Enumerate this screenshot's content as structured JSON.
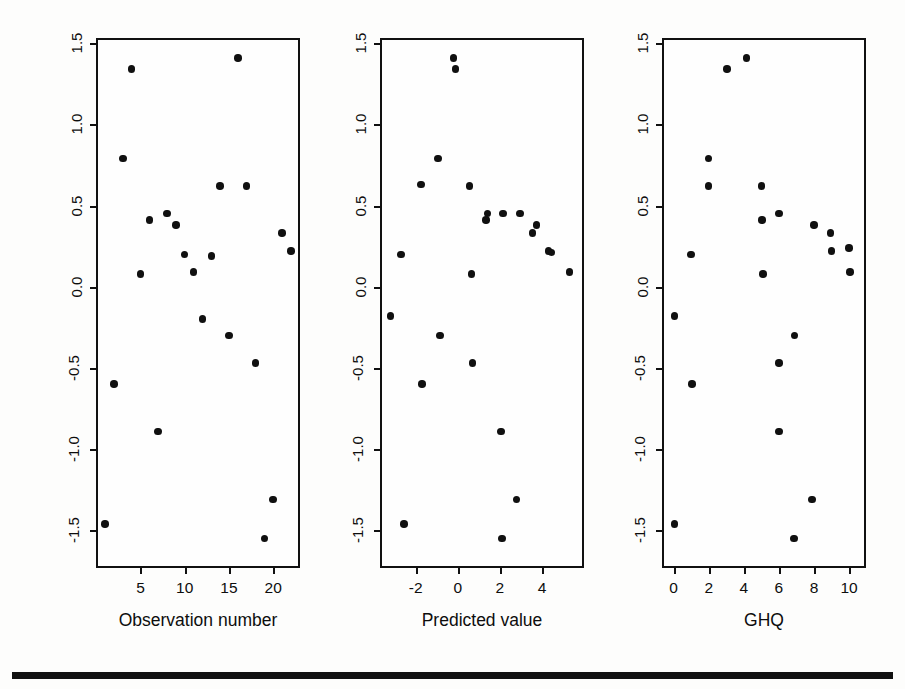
{
  "figure": {
    "shared_ylabel": "Standardized deviance residual",
    "ytick_labels": [
      "1.5",
      "1.0",
      "0.5",
      "0.0",
      "-0.5",
      "-1.0",
      "-1.5"
    ],
    "ytick_values": [
      1.5,
      1.0,
      0.5,
      0.0,
      -0.5,
      -1.0,
      -1.5
    ],
    "marker_color": "#101010",
    "frame_color": "#111111",
    "background_color": "#fdfdfc"
  },
  "chart_data": [
    {
      "type": "scatter",
      "title": "",
      "xlabel": "Observation number",
      "ylabel": "Standardized deviance residual",
      "xlim": [
        0.2,
        22.8
      ],
      "ylim": [
        -1.72,
        1.52
      ],
      "xticks": [
        5,
        10,
        15,
        20
      ],
      "xtick_labels": [
        "5",
        "10",
        "15",
        "20"
      ],
      "yticks": [
        1.5,
        1.0,
        0.5,
        0.0,
        -0.5,
        -1.0,
        -1.5
      ],
      "ytick_labels": [
        "1.5",
        "1.0",
        "0.5",
        "0.0",
        "-0.5",
        "-1.0",
        "-1.5"
      ],
      "grid": false,
      "legend": "none",
      "x": [
        1,
        2,
        3,
        4,
        5,
        6,
        7,
        8,
        9,
        10,
        11,
        12,
        13,
        14,
        15,
        16,
        17,
        18,
        19,
        20,
        21,
        22
      ],
      "y": [
        -1.46,
        -0.6,
        0.79,
        1.34,
        0.08,
        0.41,
        -0.89,
        0.45,
        0.38,
        0.2,
        0.09,
        -0.2,
        0.19,
        0.62,
        -0.3,
        1.41,
        0.62,
        -0.47,
        -1.55,
        -1.31,
        0.33,
        0.22
      ]
    },
    {
      "type": "scatter",
      "title": "",
      "xlabel": "Predicted value",
      "ylabel": "Standardized deviance residual",
      "xlim": [
        -3.6,
        5.9
      ],
      "ylim": [
        -1.72,
        1.52
      ],
      "xticks": [
        -2,
        0,
        2,
        4
      ],
      "xtick_labels": [
        "-2",
        "0",
        "2",
        "4"
      ],
      "yticks": [
        1.5,
        1.0,
        0.5,
        0.0,
        -0.5,
        -1.0,
        -1.5
      ],
      "ytick_labels": [
        "1.5",
        "1.0",
        "0.5",
        "0.0",
        "-0.5",
        "-1.0",
        "-1.5"
      ],
      "grid": false,
      "legend": "none",
      "x": [
        -3.2,
        -2.7,
        -2.55,
        -1.75,
        -1.7,
        -0.95,
        -0.85,
        -0.2,
        -0.1,
        0.55,
        0.65,
        0.7,
        1.35,
        1.4,
        2.05,
        2.1,
        2.15,
        2.8,
        2.95,
        3.55,
        3.75,
        4.3,
        4.45,
        5.3
      ],
      "y": [
        -0.18,
        0.2,
        -1.46,
        0.63,
        -0.6,
        0.79,
        -0.3,
        1.41,
        1.34,
        0.62,
        0.08,
        -0.47,
        0.41,
        0.45,
        -0.89,
        -1.55,
        0.45,
        -1.31,
        0.45,
        0.33,
        0.38,
        0.22,
        0.21,
        0.09
      ]
    },
    {
      "type": "scatter",
      "title": "",
      "xlabel": "GHQ",
      "ylabel": "Standardized deviance residual",
      "xlim": [
        -0.55,
        10.85
      ],
      "ylim": [
        -1.72,
        1.52
      ],
      "xticks": [
        0,
        2,
        4,
        6,
        8,
        10
      ],
      "xtick_labels": [
        "0",
        "2",
        "4",
        "6",
        "8",
        "10"
      ],
      "yticks": [
        1.5,
        1.0,
        0.5,
        0.0,
        -0.5,
        -1.0,
        -1.5
      ],
      "ytick_labels": [
        "1.5",
        "1.0",
        "0.5",
        "0.0",
        "-0.5",
        "-1.0",
        "-1.5"
      ],
      "grid": false,
      "legend": "none",
      "x": [
        0.05,
        0.05,
        1.0,
        1.05,
        2.0,
        2.0,
        3.05,
        4.15,
        5.0,
        5.05,
        5.1,
        6.0,
        6.0,
        6.0,
        6.85,
        6.9,
        7.9,
        8.0,
        8.95,
        9.0,
        10.0,
        10.05
      ],
      "y": [
        -0.18,
        -1.46,
        0.2,
        -0.6,
        0.79,
        0.62,
        1.34,
        1.41,
        0.62,
        0.41,
        0.08,
        0.45,
        -0.47,
        -0.89,
        -1.55,
        -0.3,
        -1.31,
        0.38,
        0.33,
        0.22,
        0.24,
        0.09
      ]
    }
  ]
}
